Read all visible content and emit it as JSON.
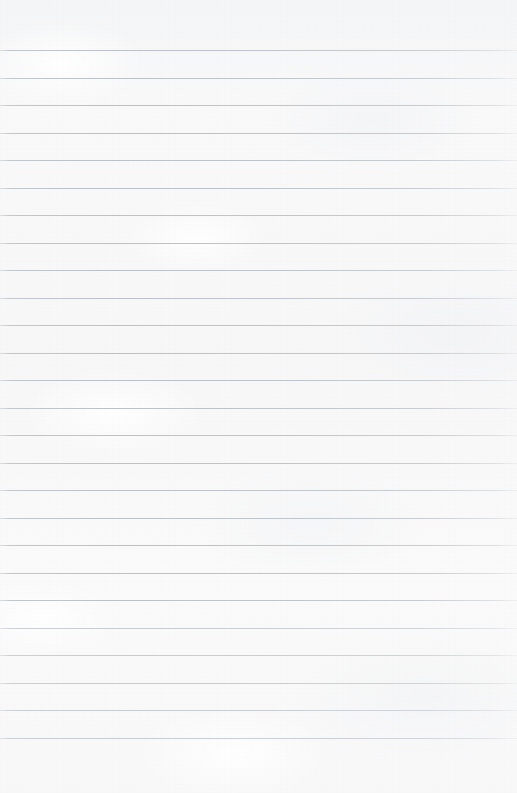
{
  "document": {
    "kind": "lined-notebook-paper",
    "title": "Blank ruled paper sheet",
    "content_text": "",
    "has_writing": false,
    "orientation": "portrait",
    "page_width_px": 517,
    "page_height_px": 793
  },
  "ruling": {
    "style": "wide-ruled horizontal lines",
    "line_count": 26,
    "first_line_y_px": 50,
    "line_spacing_px": 27.5,
    "last_line_y_px": 742,
    "line_thickness_px": 1,
    "full_bleed": true,
    "has_vertical_margin_rule": false,
    "top_margin_px": 50,
    "bottom_margin_px": 51
  },
  "colors": {
    "paper": "#f7f7f8",
    "paper_highlight": "#fafafa",
    "paper_shadow": "#f4f5f6",
    "rule_line": "#c5cace",
    "rule_line_dark": "#bbc1c7",
    "rule_line_edge_fade": "#d6dade"
  },
  "line_labels": [
    "line-1",
    "line-2",
    "line-3",
    "line-4",
    "line-5",
    "line-6",
    "line-7",
    "line-8",
    "line-9",
    "line-10",
    "line-11",
    "line-12",
    "line-13",
    "line-14",
    "line-15",
    "line-16",
    "line-17",
    "line-18",
    "line-19",
    "line-20",
    "line-21",
    "line-22",
    "line-23",
    "line-24",
    "line-25",
    "line-26"
  ]
}
